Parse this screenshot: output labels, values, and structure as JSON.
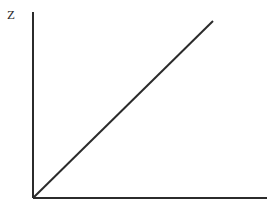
{
  "figure": {
    "width": 276,
    "height": 210,
    "background_color": "#ffffff",
    "line_color": "#2b2b2b",
    "axis_color": "#2b2b2b",
    "y_axis_label": "Z"
  },
  "chart_data": {
    "type": "line",
    "title": "",
    "xlabel": "",
    "ylabel": "Z",
    "grid": false,
    "legend": null,
    "xlim": [
      0,
      1
    ],
    "ylim": [
      0,
      1
    ],
    "x_ticks": [],
    "y_ticks": [],
    "x_tick_labels": [],
    "y_tick_labels": [],
    "annotations": [],
    "series": [
      {
        "name": "Z",
        "x": [
          0,
          1
        ],
        "values": [
          0,
          1
        ],
        "color": "#2b2b2b",
        "linewidth": 2
      }
    ]
  },
  "geometry": {
    "origin_x": 33,
    "origin_y": 198,
    "y_axis_top": 12,
    "x_axis_right": 267,
    "line_end_x": 213,
    "line_end_y": 21,
    "label_x": 7,
    "label_y": 19
  }
}
